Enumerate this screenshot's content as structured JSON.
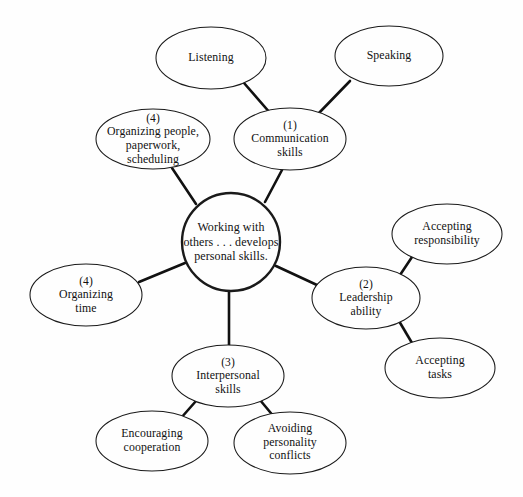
{
  "diagram": {
    "title": "Working with others . . . develops personal skills.",
    "type": "cluster-web-diagram",
    "background_color": "#fefefe",
    "line_color": "#111111",
    "center": {
      "id": "center",
      "shape": "circle",
      "label": "Working with\nothers . . . develops\npersonal skills.",
      "cx": 231,
      "cy": 242,
      "r": 49
    },
    "nodes": [
      {
        "id": "communication-skills",
        "shape": "ellipse",
        "number": "(1)",
        "label": "Communication\nskills",
        "cx": 290,
        "cy": 139,
        "rx": 56,
        "ry": 31
      },
      {
        "id": "listening",
        "shape": "ellipse",
        "number": "",
        "label": "Listening",
        "cx": 211,
        "cy": 58,
        "rx": 55,
        "ry": 31
      },
      {
        "id": "speaking",
        "shape": "ellipse",
        "number": "",
        "label": "Speaking",
        "cx": 389,
        "cy": 56,
        "rx": 54,
        "ry": 30
      },
      {
        "id": "organizing-people",
        "shape": "ellipse",
        "number": "(4)",
        "label": "Organizing people,\npaperwork,\nscheduling",
        "cx": 153,
        "cy": 139,
        "rx": 57,
        "ry": 30
      },
      {
        "id": "organizing-time",
        "shape": "ellipse",
        "number": "(4)",
        "label": "Organizing\ntime",
        "cx": 86,
        "cy": 295,
        "rx": 56,
        "ry": 31
      },
      {
        "id": "leadership-ability",
        "shape": "ellipse",
        "number": "(2)",
        "label": "Leadership\nability",
        "cx": 366,
        "cy": 298,
        "rx": 54,
        "ry": 31
      },
      {
        "id": "accepting-responsibility",
        "shape": "ellipse",
        "number": "",
        "label": "Accepting\nresponsibility",
        "cx": 447,
        "cy": 234,
        "rx": 55,
        "ry": 30
      },
      {
        "id": "accepting-tasks",
        "shape": "ellipse",
        "number": "",
        "label": "Accepting\ntasks",
        "cx": 440,
        "cy": 368,
        "rx": 55,
        "ry": 30
      },
      {
        "id": "interpersonal-skills",
        "shape": "ellipse",
        "number": "(3)",
        "label": "Interpersonal\nskills",
        "cx": 228,
        "cy": 376,
        "rx": 56,
        "ry": 31
      },
      {
        "id": "encouraging-cooperation",
        "shape": "ellipse",
        "number": "",
        "label": "Encouraging\ncooperation",
        "cx": 152,
        "cy": 441,
        "rx": 56,
        "ry": 30
      },
      {
        "id": "avoiding-personality-conflicts",
        "shape": "ellipse",
        "number": "",
        "label": "Avoiding\npersonality\nconflicts",
        "cx": 290,
        "cy": 443,
        "rx": 56,
        "ry": 31
      }
    ],
    "edges": [
      {
        "id": "edge-center-communication",
        "from": "center",
        "to": "communication-skills",
        "x1": 265,
        "y1": 202,
        "x2": 282,
        "y2": 170
      },
      {
        "id": "edge-center-organizing-people",
        "from": "center",
        "to": "organizing-people",
        "x1": 196,
        "y1": 204,
        "x2": 172,
        "y2": 168
      },
      {
        "id": "edge-center-organizing-time",
        "from": "center",
        "to": "organizing-time",
        "x1": 185,
        "y1": 263,
        "x2": 139,
        "y2": 282
      },
      {
        "id": "edge-center-leadership",
        "from": "center",
        "to": "leadership-ability",
        "x1": 276,
        "y1": 266,
        "x2": 317,
        "y2": 285
      },
      {
        "id": "edge-center-interpersonal",
        "from": "center",
        "to": "interpersonal-skills",
        "x1": 229,
        "y1": 291,
        "x2": 229,
        "y2": 345
      },
      {
        "id": "edge-communication-listening",
        "from": "communication-skills",
        "to": "listening",
        "x1": 271,
        "y1": 114,
        "x2": 244,
        "y2": 83
      },
      {
        "id": "edge-communication-speaking",
        "from": "communication-skills",
        "to": "speaking",
        "x1": 318,
        "y1": 114,
        "x2": 350,
        "y2": 81
      },
      {
        "id": "edge-leadership-accepting-responsibility",
        "from": "leadership-ability",
        "to": "accepting-responsibility",
        "x1": 400,
        "y1": 275,
        "x2": 412,
        "y2": 257
      },
      {
        "id": "edge-leadership-accepting-tasks",
        "from": "leadership-ability",
        "to": "accepting-tasks",
        "x1": 399,
        "y1": 321,
        "x2": 412,
        "y2": 343
      },
      {
        "id": "edge-interpersonal-encouraging",
        "from": "interpersonal-skills",
        "to": "encouraging-cooperation",
        "x1": 196,
        "y1": 401,
        "x2": 181,
        "y2": 418
      },
      {
        "id": "edge-interpersonal-avoiding",
        "from": "interpersonal-skills",
        "to": "avoiding-personality-conflicts",
        "x1": 260,
        "y1": 400,
        "x2": 275,
        "y2": 418
      }
    ]
  }
}
